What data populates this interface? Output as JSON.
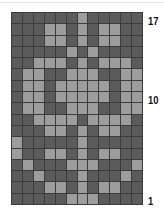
{
  "chart_data": {
    "type": "heatmap",
    "title": "",
    "columns": 12,
    "rows_count": 17,
    "colors": {
      "dark": "#5b5b5b",
      "light": "#9d9d9d",
      "grid": "#3c3c3c"
    },
    "row_labels": [
      {
        "row": 17,
        "text": "17"
      },
      {
        "row": 10,
        "text": "10"
      },
      {
        "row": 1,
        "text": "1"
      }
    ],
    "rows_top_to_bottom": [
      {
        "row": 17,
        "cells": "DDDDDDLDDDDD"
      },
      {
        "row": 16,
        "cells": "DDDLLDLDLLDD"
      },
      {
        "row": 15,
        "cells": "DDDLLDLDLLDD"
      },
      {
        "row": 14,
        "cells": "DDDDDLDLDDDD"
      },
      {
        "row": 13,
        "cells": "DDLLLDLDLLLD"
      },
      {
        "row": 12,
        "cells": "DLLDDLLLDDLL"
      },
      {
        "row": 11,
        "cells": "DLLDLLLLLDLL"
      },
      {
        "row": 10,
        "cells": "DLLDLLLLLDLL"
      },
      {
        "row": 9,
        "cells": "DLLDDLLLDDLL"
      },
      {
        "row": 8,
        "cells": "DDLLLLDLLLLD"
      },
      {
        "row": 7,
        "cells": "DDDLLDLDLLDD"
      },
      {
        "row": 6,
        "cells": "LDDDDDLDDDDD"
      },
      {
        "row": 5,
        "cells": "LDDLLDLDLLDD"
      },
      {
        "row": 4,
        "cells": "DLDDDLLLDDDL"
      },
      {
        "row": 3,
        "cells": "DDLDDDLDDDLD"
      },
      {
        "row": 2,
        "cells": "DDDLLDLDLLDD"
      },
      {
        "row": 1,
        "cells": "DDDDDLLLDDDD"
      }
    ]
  },
  "labels": {
    "top": "17",
    "middle": "10",
    "bottom": "1"
  }
}
